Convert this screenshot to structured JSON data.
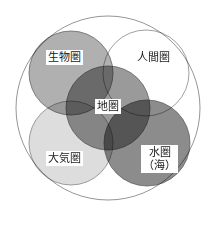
{
  "diagram": {
    "type": "venn",
    "outer": {
      "label": "",
      "cx": 108,
      "cy": 108,
      "r": 92,
      "stroke": "#7a7a7a"
    },
    "spheres": [
      {
        "id": "biosphere",
        "label": "生物圏",
        "cx": 71,
        "cy": 73,
        "r": 42,
        "fill": "#b0b0b0",
        "stroke": "#555555"
      },
      {
        "id": "anthroposphere",
        "label": "人間圏",
        "cx": 146,
        "cy": 73,
        "r": 43,
        "fill": "#ffffff",
        "stroke": "#777777"
      },
      {
        "id": "atmosphere",
        "label": "大気圏",
        "cx": 71,
        "cy": 143,
        "r": 42,
        "fill": "#dddddd",
        "stroke": "#777777"
      },
      {
        "id": "hydrosphere",
        "label_line1": "水圏",
        "label_line2": "（海）",
        "cx": 147,
        "cy": 143,
        "r": 43,
        "fill": "#8c8c8c",
        "stroke": "#555555"
      },
      {
        "id": "geosphere",
        "label": "地圏",
        "cx": 108,
        "cy": 108,
        "r": 42,
        "fill": "#9a9a9a",
        "stroke": "#555555"
      }
    ]
  }
}
